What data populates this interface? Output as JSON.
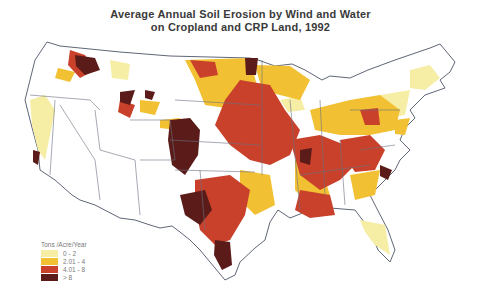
{
  "title": {
    "line1": "Average Annual Soil Erosion by Wind and Water",
    "line2": "on Cropland and CRP Land, 1992"
  },
  "legend": {
    "title": "Tons /Acre/Year",
    "items": [
      {
        "label": "0 - 2",
        "color": "#f7eea6"
      },
      {
        "label": "2.01 - 4",
        "color": "#f2c133"
      },
      {
        "label": "4.01 - 8",
        "color": "#c9412b"
      },
      {
        "label": "> 8",
        "color": "#5b1b19"
      }
    ]
  },
  "colors": {
    "background": "#ffffff",
    "state_border": "#6a7080",
    "low": "#f7eea6",
    "moderate": "#f2c133",
    "high": "#c9412b",
    "very_high": "#5b1b19"
  }
}
